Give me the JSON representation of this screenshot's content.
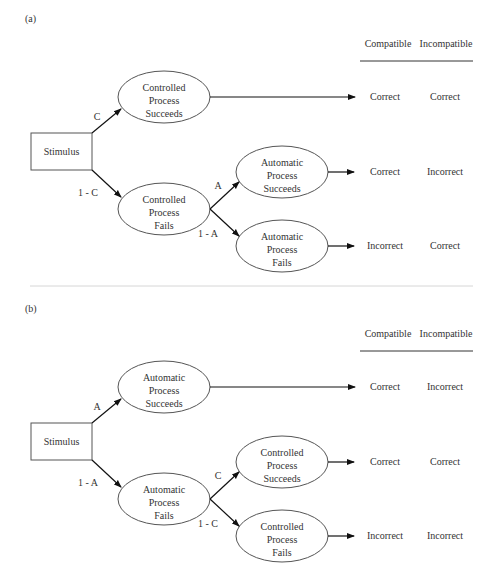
{
  "figure": {
    "panels": [
      {
        "label": "(a)",
        "column_headers": [
          "Compatible",
          "Incompatible"
        ],
        "stimulus": "Stimulus",
        "first_stage": {
          "success": {
            "lines": [
              "Controlled",
              "Process",
              "Succeeds"
            ],
            "edge_label": "C"
          },
          "failure": {
            "lines": [
              "Controlled",
              "Process",
              "Fails"
            ],
            "edge_label": "1 - C"
          }
        },
        "second_stage": {
          "success": {
            "lines": [
              "Automatic",
              "Process",
              "Succeeds"
            ],
            "edge_label": "A"
          },
          "failure": {
            "lines": [
              "Automatic",
              "Process",
              "Fails"
            ],
            "edge_label": "1 - A"
          }
        },
        "outcomes": [
          {
            "compatible": "Correct",
            "incompatible": "Correct"
          },
          {
            "compatible": "Correct",
            "incompatible": "Incorrect"
          },
          {
            "compatible": "Incorrect",
            "incompatible": "Correct"
          }
        ]
      },
      {
        "label": "(b)",
        "column_headers": [
          "Compatible",
          "Incompatible"
        ],
        "stimulus": "Stimulus",
        "first_stage": {
          "success": {
            "lines": [
              "Automatic",
              "Process",
              "Succeeds"
            ],
            "edge_label": "A"
          },
          "failure": {
            "lines": [
              "Automatic",
              "Process",
              "Fails"
            ],
            "edge_label": "1 - A"
          }
        },
        "second_stage": {
          "success": {
            "lines": [
              "Controlled",
              "Process",
              "Succeeds"
            ],
            "edge_label": "C"
          },
          "failure": {
            "lines": [
              "Controlled",
              "Process",
              "Fails"
            ],
            "edge_label": "1 - C"
          }
        },
        "outcomes": [
          {
            "compatible": "Correct",
            "incompatible": "Incorrect"
          },
          {
            "compatible": "Correct",
            "incompatible": "Correct"
          },
          {
            "compatible": "Incorrect",
            "incompatible": "Incorrect"
          }
        ]
      }
    ]
  }
}
